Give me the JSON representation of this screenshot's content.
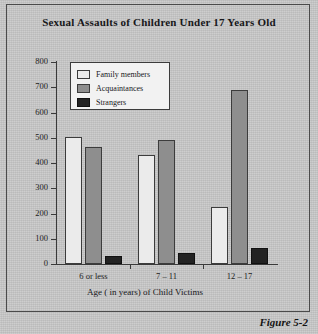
{
  "chart_data": {
    "type": "bar",
    "title": "Sexual Assaults of Children Under 17 Years Old",
    "xlabel": "Age ( in years) of Child Victims",
    "ylabel": "",
    "categories": [
      "6 or less",
      "7 – 11",
      "12 – 17"
    ],
    "series": [
      {
        "name": "Family members",
        "color": "#ebebeb",
        "values": [
          505,
          430,
          225
        ]
      },
      {
        "name": "Acquaintances",
        "color": "#8e8e8e",
        "values": [
          465,
          490,
          690
        ]
      },
      {
        "name": "Strangers",
        "color": "#232323",
        "values": [
          30,
          45,
          65
        ]
      }
    ],
    "ylim": [
      0,
      800
    ],
    "yticks": [
      0,
      100,
      200,
      300,
      400,
      500,
      600,
      700,
      800
    ],
    "ytick_labels": [
      "0",
      "100",
      "200",
      "300",
      "400",
      "500",
      "600",
      "700",
      "800"
    ],
    "grid": false,
    "legend_position": "upper-left-inside"
  },
  "caption": "Figure 5-2",
  "colors": {
    "background": "#c8c8c8",
    "frame_border": "#4b4b4b",
    "axis": "#3a3a3a",
    "bar_outline": "#3c3c3c",
    "legend_background": "#f2f2f2",
    "text": "#17171a"
  }
}
